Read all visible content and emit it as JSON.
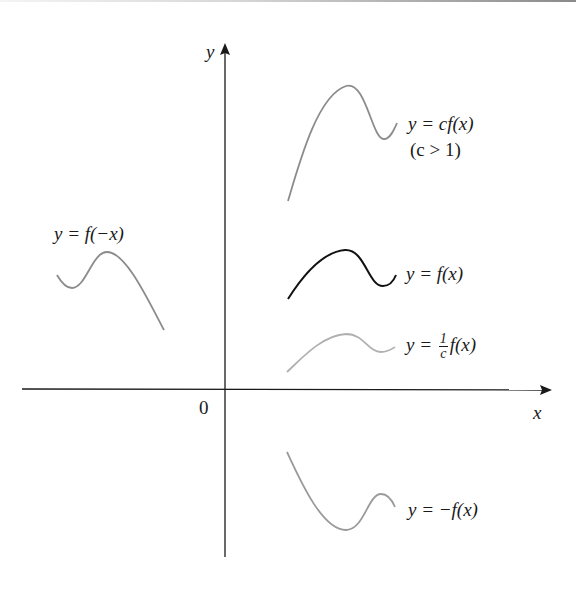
{
  "figure": {
    "axes": {
      "x_label": "x",
      "y_label": "y",
      "origin_label": "0",
      "axis_color": "#1a1a1a"
    },
    "curves": [
      {
        "id": "cf",
        "label_main": "y = cf(x)",
        "label_sub": "(c > 1)",
        "color": "#8c8c8c"
      },
      {
        "id": "f",
        "label_main": "y = f(x)",
        "color": "#111111"
      },
      {
        "id": "inv_c",
        "label_prefix": "y = ",
        "frac_num": "1",
        "frac_den": "c",
        "label_suffix": "f(x)",
        "color": "#b0b0b0"
      },
      {
        "id": "neg_f",
        "label_main": "y = −f(x)",
        "color": "#9a9a9a"
      },
      {
        "id": "f_neg_x",
        "label_main": "y = f(−x)",
        "color": "#8c8c8c"
      }
    ]
  }
}
